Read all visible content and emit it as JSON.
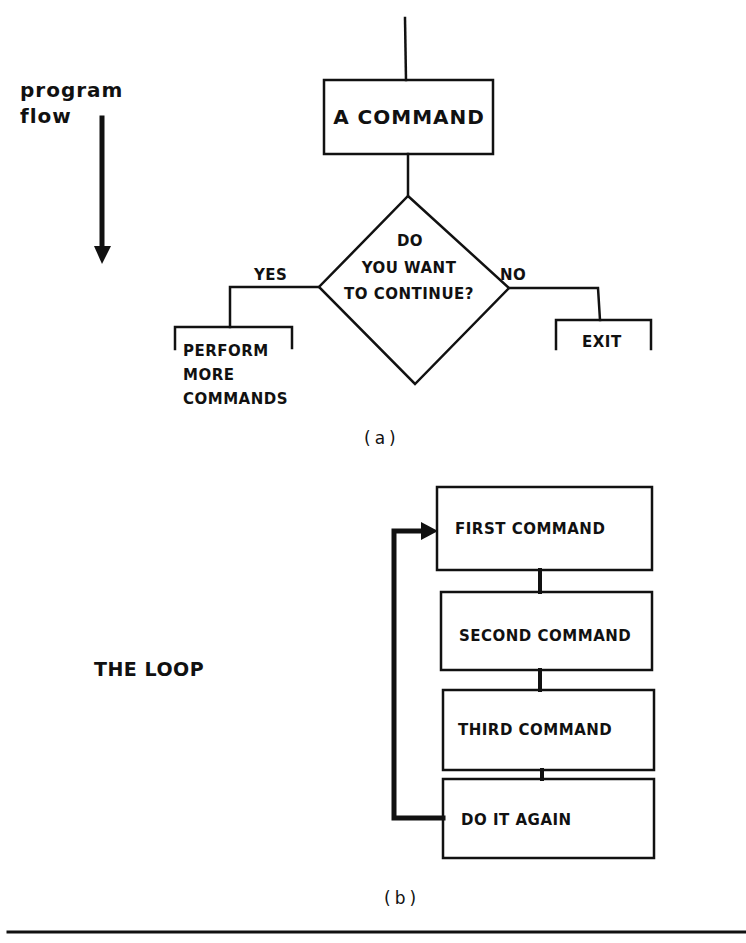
{
  "legend": {
    "flow_label_line1": "program",
    "flow_label_line2": "flow",
    "flow_arrow_icon": "down-arrow-icon"
  },
  "figure_a": {
    "command_box": "A COMMAND",
    "decision": {
      "line1": "DO",
      "line2": "YOU WANT",
      "line3": "TO CONTINUE?"
    },
    "yes_label": "YES",
    "no_label": "NO",
    "yes_branch": {
      "line1": "PERFORM",
      "line2": "MORE",
      "line3": "COMMANDS"
    },
    "no_branch": "EXIT",
    "caption": "(a)"
  },
  "figure_b": {
    "title": "THE LOOP",
    "steps": [
      {
        "label": "FIRST COMMAND"
      },
      {
        "label": "SECOND COMMAND"
      },
      {
        "label": "THIRD COMMAND"
      },
      {
        "label": "DO IT AGAIN"
      }
    ],
    "loop_arrow_icon": "loop-back-arrow-icon",
    "caption": "(b)"
  },
  "colors": {
    "ink": "#111111",
    "background": "#ffffff"
  }
}
